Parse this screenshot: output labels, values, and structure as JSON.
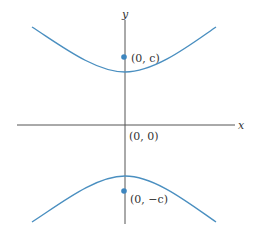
{
  "diagram": {
    "type": "hyperbola",
    "colors": {
      "curve": "#4a8fc0",
      "axis": "#555555",
      "point": "#3d86bf",
      "text": "#333333",
      "background": "#ffffff"
    },
    "axes": {
      "x_label": "x",
      "y_label": "y"
    },
    "points": [
      {
        "id": "focus-top",
        "label": "(0, c)"
      },
      {
        "id": "origin",
        "label": "(0, 0)"
      },
      {
        "id": "focus-bottom",
        "label": "(0, −c)"
      }
    ]
  }
}
